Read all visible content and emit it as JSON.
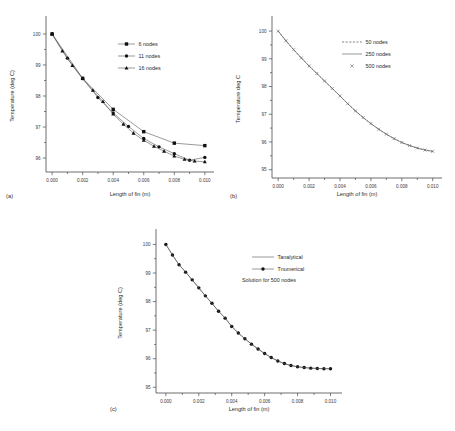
{
  "figure": {
    "background": "#ffffff",
    "axis_color": "#4a4a4a",
    "marker_color": "#111111",
    "line_color": "#555555"
  },
  "panels": {
    "a": {
      "label": "(a)",
      "xlabel": "Length of fin (m)",
      "ylabel": "Temperature (deg C)",
      "xticks": [
        "0.000",
        "0.002",
        "0.004",
        "0.006",
        "0.008",
        "0.010"
      ],
      "yticks": [
        "100",
        "99",
        "98",
        "97",
        "96"
      ],
      "legend": [
        {
          "label": "6 nodes",
          "marker": "square",
          "line": "solid"
        },
        {
          "label": "11 nodes",
          "marker": "circle",
          "line": "solid"
        },
        {
          "label": "16 nodes",
          "marker": "triangle",
          "line": "solid"
        }
      ]
    },
    "b": {
      "label": "(b)",
      "xlabel": "Length of fin (m)",
      "ylabel": "Temperature deg C",
      "xticks": [
        "0.000",
        "0.002",
        "0.004",
        "0.006",
        "0.008",
        "0.010"
      ],
      "yticks": [
        "100",
        "99",
        "98",
        "97",
        "96",
        "95"
      ],
      "legend": [
        {
          "label": "50  nodes",
          "marker": "none",
          "line": "dashed"
        },
        {
          "label": "250 nodes",
          "marker": "none",
          "line": "solid"
        },
        {
          "label": "500 nodes",
          "marker": "cross",
          "line": "none"
        }
      ]
    },
    "c": {
      "label": "(c)",
      "xlabel": "Length of fin (m)",
      "ylabel": "Temperature (deg C)",
      "xticks": [
        "0.000",
        "0.002",
        "0.004",
        "0.006",
        "0.008",
        "0.010"
      ],
      "yticks": [
        "100",
        "99",
        "98",
        "97",
        "96",
        "95"
      ],
      "legend": [
        {
          "label": "Tanalytical",
          "marker": "none",
          "line": "solid"
        },
        {
          "label": "Tnumerical",
          "marker": "circle",
          "line": "solid"
        }
      ],
      "note": "Solution for 500 nodes"
    }
  },
  "chart_data": [
    {
      "id": "a",
      "type": "line",
      "title": "",
      "xlabel": "Length of fin (m)",
      "ylabel": "Temperature (deg C)",
      "xlim": [
        -0.0004,
        0.0106
      ],
      "ylim": [
        95.55,
        100.45
      ],
      "grid": false,
      "legend_position": "upper-right-inside",
      "x": [
        0.0,
        0.002,
        0.004,
        0.006,
        0.008,
        0.01
      ],
      "series": [
        {
          "name": "6 nodes",
          "marker": "square",
          "x": [
            0.0,
            0.002,
            0.004,
            0.006,
            0.008,
            0.01
          ],
          "values": [
            100.0,
            98.57,
            97.57,
            96.85,
            96.48,
            96.4
          ]
        },
        {
          "name": "11 nodes",
          "marker": "circle",
          "x": [
            0.0,
            0.001,
            0.002,
            0.003,
            0.004,
            0.005,
            0.006,
            0.007,
            0.008,
            0.009,
            0.01
          ],
          "values": [
            100.0,
            99.22,
            98.56,
            97.95,
            97.45,
            97.02,
            96.63,
            96.36,
            96.14,
            95.93,
            96.02
          ]
        },
        {
          "name": "16 nodes",
          "marker": "triangle",
          "x": [
            0.0,
            0.00067,
            0.00133,
            0.002,
            0.00267,
            0.00333,
            0.004,
            0.00467,
            0.00533,
            0.006,
            0.00667,
            0.00733,
            0.008,
            0.00867,
            0.00933,
            0.01
          ],
          "values": [
            100.0,
            99.45,
            98.98,
            98.56,
            98.18,
            97.82,
            97.42,
            97.09,
            96.8,
            96.57,
            96.38,
            96.22,
            96.06,
            95.96,
            95.9,
            95.88
          ]
        }
      ]
    },
    {
      "id": "b",
      "type": "line",
      "title": "",
      "xlabel": "Length of fin (m)",
      "ylabel": "Temperature deg C",
      "xlim": [
        -0.0004,
        0.0106
      ],
      "ylim": [
        94.7,
        100.4
      ],
      "grid": false,
      "legend_position": "upper-right-inside",
      "series": [
        {
          "name": "50  nodes",
          "marker": "none",
          "line": "dashed",
          "x": [
            0.0,
            0.0005,
            0.001,
            0.0015,
            0.002,
            0.0025,
            0.003,
            0.0035,
            0.004,
            0.0045,
            0.005,
            0.0055,
            0.006,
            0.0065,
            0.007,
            0.0075,
            0.008,
            0.0085,
            0.009,
            0.0095,
            0.01
          ],
          "values": [
            100.0,
            99.65,
            99.33,
            99.03,
            98.74,
            98.47,
            98.2,
            97.93,
            97.66,
            97.38,
            97.12,
            96.88,
            96.66,
            96.46,
            96.28,
            96.12,
            95.98,
            95.87,
            95.78,
            95.71,
            95.66
          ]
        },
        {
          "name": "250 nodes",
          "marker": "none",
          "line": "solid",
          "x": [
            0.0,
            0.0005,
            0.001,
            0.0015,
            0.002,
            0.0025,
            0.003,
            0.0035,
            0.004,
            0.0045,
            0.005,
            0.0055,
            0.006,
            0.0065,
            0.007,
            0.0075,
            0.008,
            0.0085,
            0.009,
            0.0095,
            0.01
          ],
          "values": [
            100.0,
            99.65,
            99.33,
            99.03,
            98.74,
            98.47,
            98.2,
            97.93,
            97.66,
            97.38,
            97.12,
            96.88,
            96.66,
            96.46,
            96.28,
            96.12,
            95.98,
            95.87,
            95.78,
            95.71,
            95.66
          ]
        },
        {
          "name": "500 nodes",
          "marker": "cross",
          "line": "none",
          "x": [
            0.0,
            0.0005,
            0.001,
            0.0015,
            0.002,
            0.0025,
            0.003,
            0.0035,
            0.004,
            0.0045,
            0.005,
            0.0055,
            0.006,
            0.0065,
            0.007,
            0.0075,
            0.008,
            0.0085,
            0.009,
            0.0095,
            0.01
          ],
          "values": [
            100.0,
            99.65,
            99.33,
            99.03,
            98.74,
            98.47,
            98.2,
            97.93,
            97.66,
            97.38,
            97.12,
            96.88,
            96.66,
            96.46,
            96.28,
            96.12,
            95.98,
            95.87,
            95.78,
            95.71,
            95.66
          ]
        }
      ]
    },
    {
      "id": "c",
      "type": "scatter",
      "title": "",
      "xlabel": "Length of fin (m)",
      "ylabel": "Temperature (deg C)",
      "xlim": [
        -0.0006,
        0.0107
      ],
      "ylim": [
        94.8,
        100.4
      ],
      "grid": false,
      "legend_position": "upper-right-inside",
      "annotation": "Solution for 500 nodes",
      "series": [
        {
          "name": "Tnumerical",
          "marker": "circle",
          "x": [
            0.0,
            0.0004,
            0.0008,
            0.0012,
            0.0016,
            0.002,
            0.0024,
            0.0028,
            0.0032,
            0.0036,
            0.004,
            0.0044,
            0.0048,
            0.0052,
            0.0056,
            0.006,
            0.0064,
            0.0068,
            0.0072,
            0.0076,
            0.008,
            0.0084,
            0.0088,
            0.0092,
            0.0096,
            0.01
          ],
          "values": [
            100.0,
            99.63,
            99.29,
            99.03,
            98.76,
            98.48,
            98.2,
            97.94,
            97.66,
            97.42,
            97.13,
            96.9,
            96.7,
            96.51,
            96.34,
            96.18,
            96.04,
            95.92,
            95.83,
            95.76,
            95.72,
            95.69,
            95.67,
            95.66,
            95.65,
            95.65
          ]
        },
        {
          "name": "Tanalytical",
          "marker": "none",
          "x": [
            0.0,
            0.0004,
            0.0008,
            0.0012,
            0.0016,
            0.002,
            0.0024,
            0.0028,
            0.0032,
            0.0036,
            0.004,
            0.0044,
            0.0048,
            0.0052,
            0.0056,
            0.006,
            0.0064,
            0.0068,
            0.0072,
            0.0076,
            0.008,
            0.0084,
            0.0088,
            0.0092,
            0.0096,
            0.01
          ],
          "values": [
            100.0,
            99.63,
            99.29,
            99.03,
            98.76,
            98.48,
            98.2,
            97.94,
            97.66,
            97.42,
            97.13,
            96.9,
            96.7,
            96.51,
            96.34,
            96.18,
            96.04,
            95.92,
            95.83,
            95.76,
            95.72,
            95.69,
            95.67,
            95.66,
            95.65,
            95.65
          ]
        }
      ]
    }
  ]
}
